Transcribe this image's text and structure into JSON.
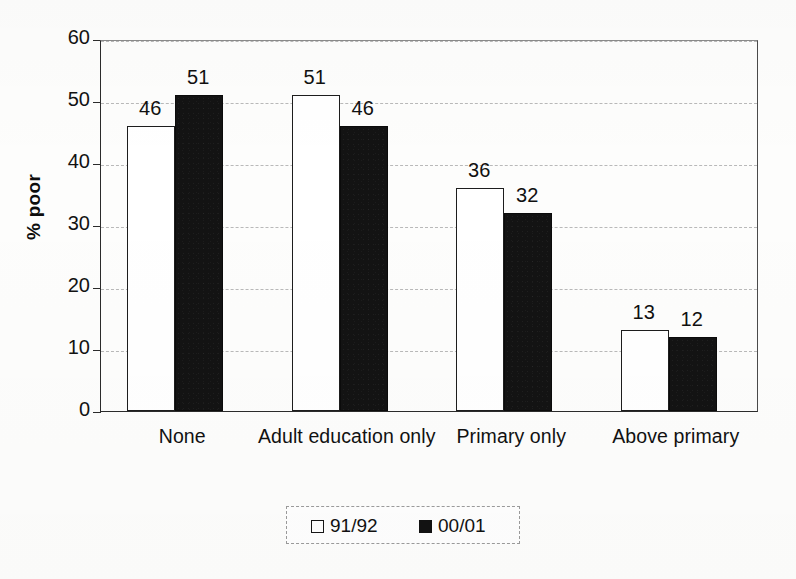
{
  "chart_data": {
    "type": "bar",
    "title": "",
    "subtitle": "",
    "xlabel": "",
    "ylabel": "% poor",
    "ylim": [
      0,
      60
    ],
    "ytick_labels": [
      "0",
      "10",
      "20",
      "30",
      "40",
      "50",
      "60"
    ],
    "ytick_values": [
      0,
      10,
      20,
      30,
      40,
      50,
      60
    ],
    "grid": true,
    "legend_position": "bottom",
    "categories": [
      "None",
      "Adult education only",
      "Primary only",
      "Above primary"
    ],
    "series": [
      {
        "name": "91/92",
        "values": [
          46,
          51,
          36,
          13
        ],
        "labels": [
          "46",
          "51",
          "36",
          "13"
        ],
        "style": "open",
        "color": "#ffffff",
        "edge_color": "#1d1d1d"
      },
      {
        "name": "00/01",
        "values": [
          51,
          46,
          32,
          12
        ],
        "labels": [
          "51",
          "46",
          "32",
          "12"
        ],
        "style": "filled",
        "color": "#131313",
        "edge_color": "#0b0b0b"
      }
    ]
  },
  "axis": {
    "y_title": "% poor"
  },
  "legend": {
    "entries": [
      {
        "label": "91/92",
        "swatch": "open-square-swatch"
      },
      {
        "label": "00/01",
        "swatch": "filled-square-swatch"
      }
    ]
  }
}
